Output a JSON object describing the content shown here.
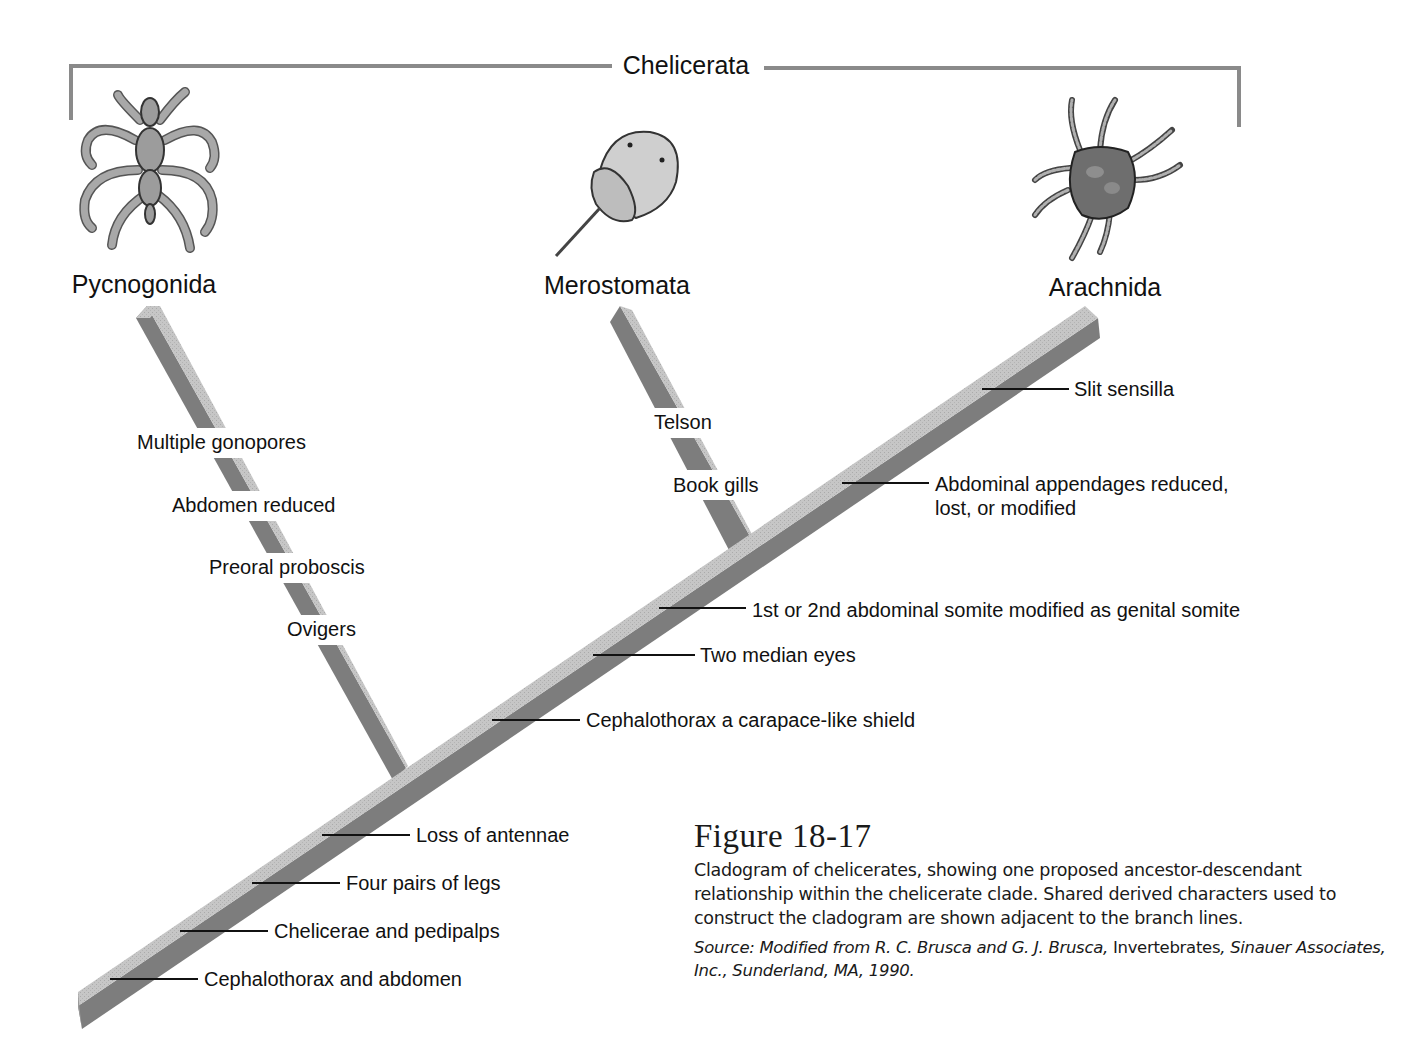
{
  "figure": {
    "title": "Figure 18-17",
    "caption": "Cladogram of chelicerates, showing one proposed ancestor-descendant relationship within the chelicerate clade. Shared derived characters used to construct the cladogram are shown adjacent to the branch lines.",
    "source_prefix": "Source: Modified from R. C. Brusca and G. J. Brusca, ",
    "source_book": "Invertebrates",
    "source_suffix": ", Sinauer Associates, Inc., Sunderland, MA, 1990."
  },
  "clade": {
    "label": "Chelicerata",
    "bracket_color": "#8a8a8a"
  },
  "taxa": [
    {
      "name": "Pycnogonida",
      "icon": "sea-spider-icon"
    },
    {
      "name": "Merostomata",
      "icon": "horseshoe-crab-icon"
    },
    {
      "name": "Arachnida",
      "icon": "mite-icon"
    }
  ],
  "characters": {
    "pycnogonida_branch": [
      "Multiple gonopores",
      "Abdomen reduced",
      "Preoral proboscis",
      "Ovigers"
    ],
    "merostomata_branch": [
      "Telson",
      "Book gills"
    ],
    "trunk": [
      "Cephalothorax and abdomen",
      "Chelicerae and pedipalps",
      "Four pairs of legs",
      "Loss of antennae",
      "Cephalothorax a carapace-like shield",
      "Two median eyes",
      "1st or 2nd abdominal somite modified as genital somite",
      "Abdominal appendages reduced,",
      "lost, or modified",
      "Slit sensilla"
    ]
  },
  "colors": {
    "branch_top": "#c4c4c4",
    "branch_side": "#7d7d7d",
    "tick": "#111111"
  }
}
